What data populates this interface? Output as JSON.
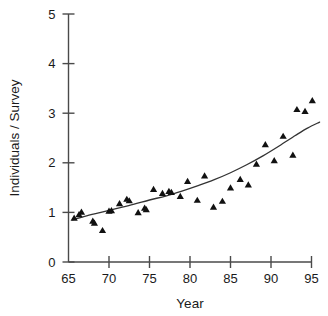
{
  "chart_data": {
    "type": "scatter",
    "title": "",
    "subtitle": "",
    "xlabel": "Year",
    "ylabel": "Individuals / Survey",
    "xlim": [
      65,
      96
    ],
    "ylim": [
      0,
      5
    ],
    "xticks": [
      65,
      70,
      75,
      80,
      85,
      90,
      95
    ],
    "yticks": [
      0,
      1,
      2,
      3,
      4,
      5
    ],
    "xtick_labels": [
      "65",
      "70",
      "75",
      "80",
      "85",
      "90",
      "95"
    ],
    "ytick_labels": [
      "0",
      "1",
      "2",
      "3",
      "4",
      "5"
    ],
    "grid": false,
    "legend": false,
    "legend_position": "none",
    "marker": "triangle-up",
    "marker_color": "#111111",
    "line_color": "#333333",
    "series": [
      {
        "name": "Observed individuals per survey",
        "type": "scatter",
        "marker": "triangle-up",
        "points": [
          {
            "x": 65.7,
            "y": 0.88
          },
          {
            "x": 66.3,
            "y": 0.95
          },
          {
            "x": 66.6,
            "y": 1.0
          },
          {
            "x": 68.0,
            "y": 0.82
          },
          {
            "x": 68.2,
            "y": 0.78
          },
          {
            "x": 69.2,
            "y": 0.63
          },
          {
            "x": 70.0,
            "y": 1.02
          },
          {
            "x": 70.3,
            "y": 1.03
          },
          {
            "x": 71.3,
            "y": 1.17
          },
          {
            "x": 72.2,
            "y": 1.26
          },
          {
            "x": 72.5,
            "y": 1.23
          },
          {
            "x": 73.6,
            "y": 0.99
          },
          {
            "x": 74.4,
            "y": 1.08
          },
          {
            "x": 74.6,
            "y": 1.05
          },
          {
            "x": 75.5,
            "y": 1.46
          },
          {
            "x": 76.6,
            "y": 1.38
          },
          {
            "x": 77.4,
            "y": 1.42
          },
          {
            "x": 77.7,
            "y": 1.4
          },
          {
            "x": 78.8,
            "y": 1.32
          },
          {
            "x": 79.7,
            "y": 1.62
          },
          {
            "x": 80.9,
            "y": 1.24
          },
          {
            "x": 81.8,
            "y": 1.73
          },
          {
            "x": 82.9,
            "y": 1.1
          },
          {
            "x": 84.0,
            "y": 1.22
          },
          {
            "x": 85.0,
            "y": 1.49
          },
          {
            "x": 86.2,
            "y": 1.66
          },
          {
            "x": 87.2,
            "y": 1.55
          },
          {
            "x": 88.2,
            "y": 1.97
          },
          {
            "x": 89.3,
            "y": 2.36
          },
          {
            "x": 90.4,
            "y": 2.04
          },
          {
            "x": 91.5,
            "y": 2.53
          },
          {
            "x": 92.7,
            "y": 2.15
          },
          {
            "x": 93.2,
            "y": 3.07
          },
          {
            "x": 94.2,
            "y": 3.03
          },
          {
            "x": 95.1,
            "y": 3.25
          }
        ]
      },
      {
        "name": "Fitted trend",
        "type": "line",
        "points": [
          {
            "x": 65.5,
            "y": 0.85
          },
          {
            "x": 67.0,
            "y": 0.92
          },
          {
            "x": 69.0,
            "y": 1.0
          },
          {
            "x": 71.0,
            "y": 1.08
          },
          {
            "x": 73.0,
            "y": 1.16
          },
          {
            "x": 75.0,
            "y": 1.25
          },
          {
            "x": 77.0,
            "y": 1.33
          },
          {
            "x": 79.0,
            "y": 1.43
          },
          {
            "x": 81.0,
            "y": 1.54
          },
          {
            "x": 83.0,
            "y": 1.66
          },
          {
            "x": 85.0,
            "y": 1.8
          },
          {
            "x": 87.0,
            "y": 1.96
          },
          {
            "x": 89.0,
            "y": 2.14
          },
          {
            "x": 91.0,
            "y": 2.34
          },
          {
            "x": 93.0,
            "y": 2.55
          },
          {
            "x": 94.5,
            "y": 2.7
          },
          {
            "x": 96.0,
            "y": 2.82
          }
        ]
      }
    ]
  }
}
